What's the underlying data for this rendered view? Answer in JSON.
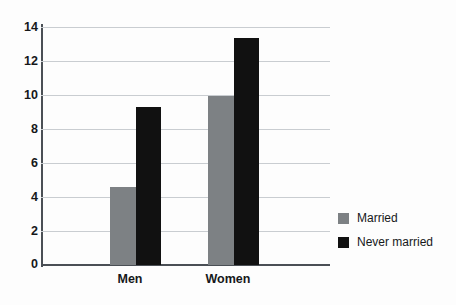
{
  "chart_data": {
    "type": "bar",
    "title": "",
    "subtitle": "",
    "xlabel": "",
    "ylabel": "",
    "categories": [
      "Men",
      "Women"
    ],
    "series": [
      {
        "name": "Married",
        "color": "#7d8184",
        "values": [
          4.6,
          10.0
        ]
      },
      {
        "name": "Never married",
        "color": "#111111",
        "values": [
          9.35,
          13.4
        ]
      }
    ],
    "ylim": [
      0,
      14
    ],
    "yticks": [
      0,
      2,
      4,
      6,
      8,
      10,
      12,
      14
    ],
    "ytick_labels": [
      "0",
      "2",
      "4",
      "6",
      "8",
      "10",
      "12",
      "14"
    ],
    "grid": true,
    "grid_axis": "y",
    "legend_position": "right",
    "legend_entries": [
      "Married",
      "Never married"
    ]
  },
  "axes": {
    "y_tick_labels": [
      "14",
      "12",
      "10",
      "8",
      "6",
      "4",
      "2",
      "0"
    ],
    "x_tick_labels": [
      "Men",
      "Women"
    ]
  },
  "legend": {
    "items": [
      {
        "label": "Married",
        "swatch": "married-swatch-icon"
      },
      {
        "label": "Never married",
        "swatch": "never-married-swatch-icon"
      }
    ]
  },
  "colors": {
    "married": "#7d8184",
    "never_married": "#111111",
    "gridline": "#c9cdd1",
    "axis": "#4a4f55",
    "text": "#16181a",
    "background": "#fdfdfd"
  }
}
